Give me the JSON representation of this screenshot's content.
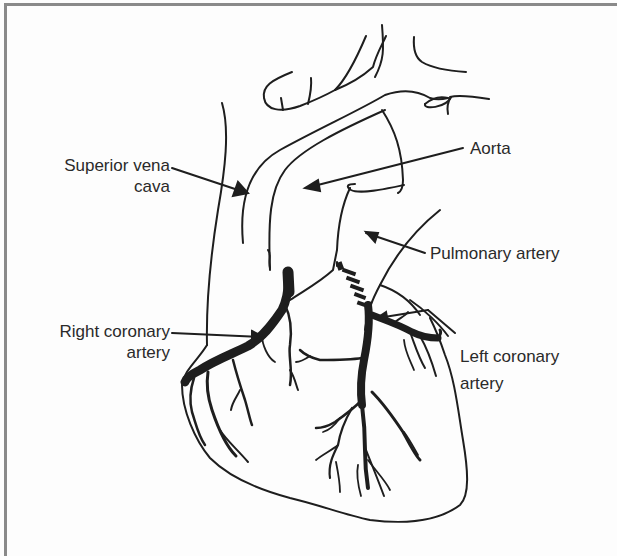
{
  "figure": {
    "line_color": "#1e1e1e",
    "text_color": "#2a2a2a",
    "border_color": "#8a8a8a",
    "background": "#fdfdfd"
  },
  "labels": {
    "superior_vena_cava": {
      "line1": "Superior vena",
      "line2": "cava"
    },
    "aorta": {
      "line1": "Aorta"
    },
    "pulmonary_artery": {
      "line1": "Pulmonary artery"
    },
    "right_coronary_artery": {
      "line1": "Right coronary",
      "line2": "artery"
    },
    "left_coronary_artery": {
      "line1": "Left coronary",
      "line2": "artery"
    }
  }
}
